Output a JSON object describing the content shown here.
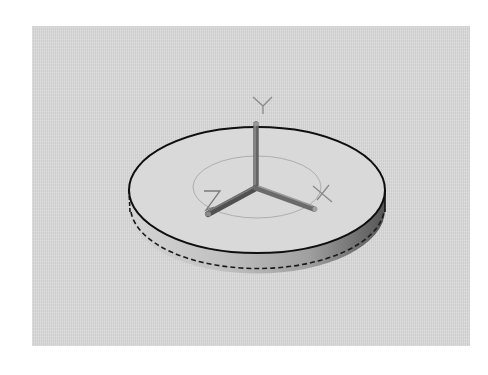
{
  "viewport": {
    "type": "3d-cad-viewport",
    "background_color": "#d8d8d8",
    "object": "cylinder-disk"
  },
  "ucs_icon": {
    "labels": {
      "x": "X",
      "y": "Y",
      "z": "Z"
    },
    "axis_color": "#6e6e6e",
    "label_color": "#8a8a8a"
  },
  "disk": {
    "edge_color": "#111111",
    "rim_light_color": "#c4c4c4",
    "rim_dark_color": "#6a6a6a",
    "top_face_color": "#dadada",
    "inner_circle_color": "#a8a8a8"
  }
}
